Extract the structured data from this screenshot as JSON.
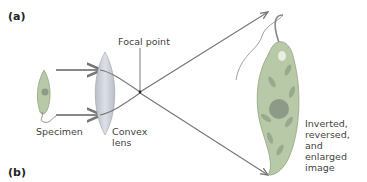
{
  "panels": {
    "a": "(a)",
    "b": "(b)"
  },
  "labels": {
    "focal_point": "Focal point",
    "specimen": "Specimen",
    "convex_lens_1": "Convex",
    "convex_lens_2": "lens",
    "image_1": "Inverted,",
    "image_2": "reversed, and",
    "image_3": "enlarged",
    "image_4": "image"
  },
  "colors": {
    "organism_fill": "#b8c9a8",
    "organism_stroke": "#8fa585",
    "nucleus": "#8d9a88",
    "chloroplast": "#98aa8e",
    "lens_fill": "#c9cdd6",
    "ray": "#777777"
  }
}
